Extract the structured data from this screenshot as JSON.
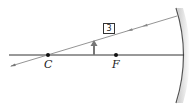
{
  "diagram": {
    "type": "concave-mirror-ray-diagram",
    "points": [
      {
        "id": "C",
        "label": "C"
      },
      {
        "id": "F",
        "label": "F"
      }
    ],
    "ray_label": "3",
    "colors": {
      "axis": "#333333",
      "ray": "#777777",
      "object": "#777777",
      "mirror": "#555555",
      "mirror_shade": "#cccccc"
    }
  }
}
